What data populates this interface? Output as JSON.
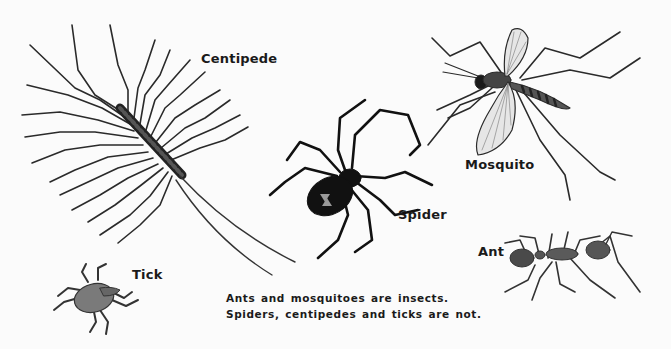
{
  "illustration": {
    "title": "Insects and non-insects",
    "organisms": [
      {
        "id": "centipede",
        "label": "Centipede",
        "is_insect": false
      },
      {
        "id": "mosquito",
        "label": "Mosquito",
        "is_insect": true
      },
      {
        "id": "spider",
        "label": "Spider",
        "is_insect": false
      },
      {
        "id": "tick",
        "label": "Tick",
        "is_insect": false
      },
      {
        "id": "ant",
        "label": "Ant",
        "is_insect": true
      }
    ],
    "labels": {
      "centipede": "Centipede",
      "mosquito": "Mosquito",
      "spider": "Spider",
      "tick": "Tick",
      "ant": "Ant"
    },
    "caption": {
      "line1": "Ants and mosquitoes are insects.",
      "line2": "Spiders, centipedes and ticks are not."
    },
    "colors": {
      "background": "#fbfbfb",
      "ink": "#1a1a1a",
      "tick_body": "#7a7a7a",
      "ant_body": "#5a5a5a",
      "spider_marking": "#9a9a9a"
    }
  }
}
